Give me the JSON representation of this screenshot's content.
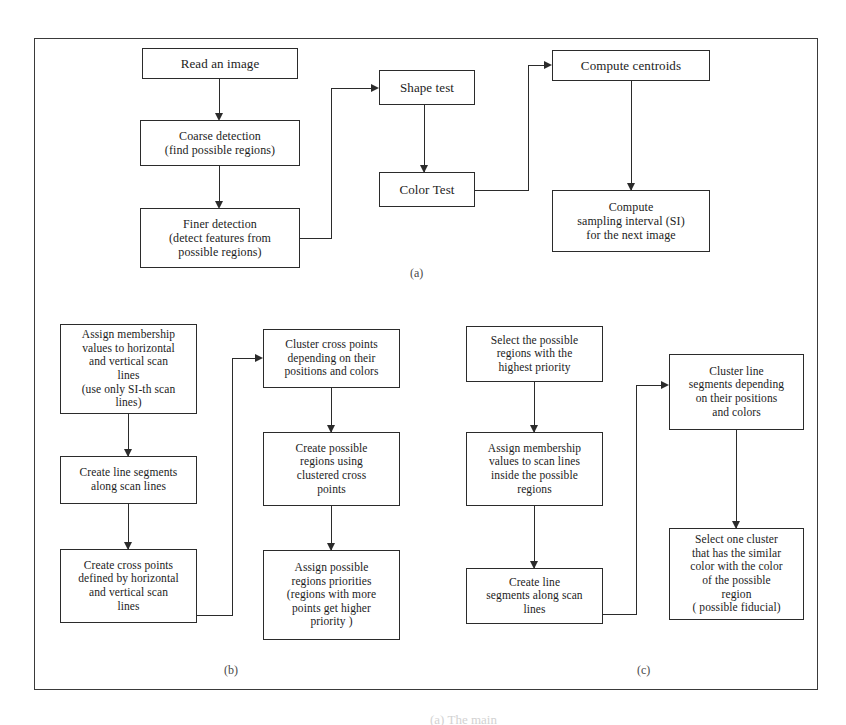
{
  "figure": {
    "panels": [
      {
        "id": "a",
        "label": "(a)"
      },
      {
        "id": "b",
        "label": "(b)"
      },
      {
        "id": "c",
        "label": "(c)"
      }
    ],
    "bottom_caption": "(a) The main"
  },
  "panel_a": {
    "nodes": {
      "read_image": "Read an image",
      "coarse_detection": "Coarse detection\n(find possible regions)",
      "finer_detection": "Finer detection\n(detect  features from\npossible regions)",
      "shape_test": "Shape test",
      "color_test": "Color Test",
      "compute_centroids": "Compute  centroids",
      "compute_si": "Compute\nsampling interval (SI)\nfor the  next image"
    }
  },
  "panel_b": {
    "nodes": {
      "assign_membership": "Assign membership\nvalues to  horizontal\nand vertical  scan\nlines\n(use only SI-th scan\nlines)",
      "create_line_segments": "Create  line  segments\nalong scan  lines",
      "create_cross_points": "Create cross  points\ndefined by horizontal\nand vertical  scan\nlines",
      "cluster_cross_points": "Cluster cross  points\ndepending  on their\npositions and  colors",
      "create_possible_regions": "Create  possible\nregions using\nclustered  cross\npoints",
      "assign_priorities": "Assign possible\nregions  priorities\n(regions with more\npoints get higher\npriority )"
    }
  },
  "panel_c": {
    "nodes": {
      "select_regions": "Select the possible\nregions  with the\nhighest  priority",
      "assign_membership_inside": "Assign membership\nvalues to scan  lines\ninside the possible\nregions",
      "create_line_segments": "Create line\nsegments along  scan\nlines",
      "cluster_line_segments": "Cluster  line\nsegments depending\non their positions\nand colors",
      "select_one_cluster": "Select one  cluster\nthat has the similar\ncolor with the color\nof the possible\nregion\n( possible fiducial)"
    }
  },
  "colors": {
    "ink": "#2b2b2b",
    "frame": "#3a3a3a",
    "background": "#ffffff"
  }
}
